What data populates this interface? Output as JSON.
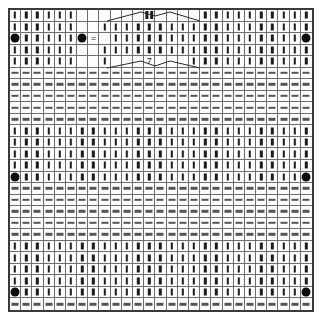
{
  "chart": {
    "columns": 27,
    "rows": 26,
    "cell_width_px": 11.3,
    "cell_height_px": 11.6,
    "grid_color": "#6e6e6e",
    "border_color": "#3a3a3a",
    "background_color": "#ffffff",
    "symbol_color": "#1c1c1c"
  },
  "legend": {
    "knit": "knit-bar",
    "purl": "purl-dash",
    "dot": "bobble-dot",
    "equals": "equals-symbol",
    "seven": "decrease-seven",
    "dblknit": "double-knit-bar",
    "blank": "no-stitch"
  },
  "symbols": {
    "knit_label": "|",
    "purl_label": "—",
    "dot_label": "●",
    "equals_label": "=",
    "seven_label": "7",
    "blank_label": ""
  },
  "band_sequence": [
    "knit",
    "knit",
    "knit",
    "knit",
    "knit",
    "purl",
    "purl",
    "purl",
    "purl",
    "purl"
  ],
  "special_cells": [
    {
      "row": 2,
      "col": 0,
      "symbol": "dot"
    },
    {
      "row": 2,
      "col": 6,
      "symbol": "dot"
    },
    {
      "row": 2,
      "col": 7,
      "symbol": "equals"
    },
    {
      "row": 2,
      "col": 26,
      "symbol": "dot"
    },
    {
      "row": 0,
      "col": 12,
      "symbol": "dblknit"
    },
    {
      "row": 4,
      "col": 12,
      "symbol": "seven"
    },
    {
      "row": 14,
      "col": 0,
      "symbol": "dot"
    },
    {
      "row": 14,
      "col": 26,
      "symbol": "dot"
    },
    {
      "row": 24,
      "col": 0,
      "symbol": "dot"
    },
    {
      "row": 24,
      "col": 26,
      "symbol": "dot"
    }
  ],
  "blank_cells": [
    {
      "row": 0,
      "col": 8
    },
    {
      "row": 0,
      "col": 9
    },
    {
      "row": 0,
      "col": 10
    },
    {
      "row": 0,
      "col": 11
    },
    {
      "row": 0,
      "col": 13
    },
    {
      "row": 0,
      "col": 14
    },
    {
      "row": 0,
      "col": 15
    },
    {
      "row": 0,
      "col": 16
    },
    {
      "row": 0,
      "col": 6
    },
    {
      "row": 0,
      "col": 7
    },
    {
      "row": 1,
      "col": 6
    },
    {
      "row": 1,
      "col": 7
    },
    {
      "row": 2,
      "col": 8
    },
    {
      "row": 3,
      "col": 6
    },
    {
      "row": 3,
      "col": 7
    },
    {
      "row": 4,
      "col": 6
    },
    {
      "row": 4,
      "col": 7
    },
    {
      "row": 4,
      "col": 9
    },
    {
      "row": 4,
      "col": 10
    },
    {
      "row": 4,
      "col": 11
    },
    {
      "row": 4,
      "col": 13
    },
    {
      "row": 4,
      "col": 14
    },
    {
      "row": 4,
      "col": 15
    }
  ],
  "motif_lines": [
    {
      "x1": 97,
      "y1": 11,
      "x2": 131,
      "y2": 2
    },
    {
      "x1": 131,
      "y1": 2,
      "x2": 145,
      "y2": 6
    },
    {
      "x1": 145,
      "y1": 6,
      "x2": 160,
      "y2": 2
    },
    {
      "x1": 160,
      "y1": 2,
      "x2": 190,
      "y2": 11
    },
    {
      "x1": 97,
      "y1": 58,
      "x2": 131,
      "y2": 51
    },
    {
      "x1": 131,
      "y1": 51,
      "x2": 145,
      "y2": 56
    },
    {
      "x1": 145,
      "y1": 56,
      "x2": 160,
      "y2": 51
    },
    {
      "x1": 160,
      "y1": 51,
      "x2": 190,
      "y2": 58
    }
  ]
}
